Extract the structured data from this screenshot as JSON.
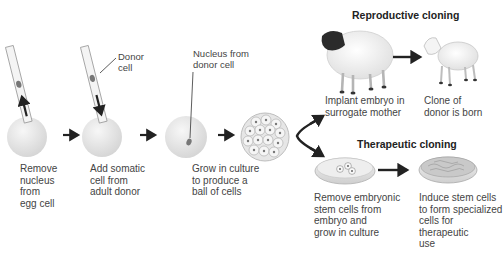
{
  "diagram": {
    "type": "somatic-cell-nuclear-transfer-process",
    "branches": {
      "reproductive": {
        "title": "Reproductive cloning"
      },
      "therapeutic": {
        "title": "Therapeutic cloning"
      }
    },
    "callouts": {
      "donor_cell": "Donor\ncell",
      "nucleus_from_donor": "Nucleus from\ndonor cell"
    },
    "steps": [
      {
        "id": "remove-nucleus",
        "label": "Remove\nnucleus\nfrom\negg cell"
      },
      {
        "id": "add-somatic-cell",
        "label": "Add somatic\ncell  from\nadult donor"
      },
      {
        "id": "grow-in-culture",
        "label": "Grow in culture\nto produce a\nball of cells"
      },
      {
        "id": "implant-embryo",
        "label": "Implant embryo in\nsurrogate mother"
      },
      {
        "id": "clone-born",
        "label": "Clone of\ndonor is born"
      },
      {
        "id": "remove-stem-cells",
        "label": "Remove embryonic\nstem cells from\nembryo and\ngrow in culture"
      },
      {
        "id": "induce-stem-cells",
        "label": "Induce stem cells\nto form specialized\ncells for therapeutic\nuse"
      }
    ],
    "edges": [
      {
        "from": "remove-nucleus",
        "to": "add-somatic-cell"
      },
      {
        "from": "add-somatic-cell",
        "to": "grow-in-culture"
      },
      {
        "from": "grow-in-culture",
        "to": "blastocyst"
      },
      {
        "from": "blastocyst",
        "to": "implant-embryo"
      },
      {
        "from": "blastocyst",
        "to": "remove-stem-cells"
      },
      {
        "from": "implant-embryo",
        "to": "clone-born"
      },
      {
        "from": "remove-stem-cells",
        "to": "induce-stem-cells"
      }
    ],
    "colors": {
      "arrow": "#222222",
      "cell_fill": "#e4e4e4",
      "text": "#444444",
      "sheep_face": "#2b2b2b"
    }
  }
}
